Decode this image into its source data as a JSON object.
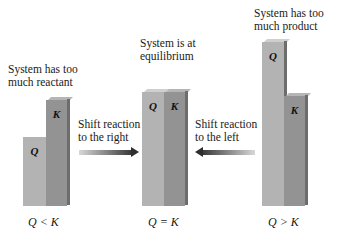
{
  "groups": [
    {
      "id": "left",
      "caption": [
        "System has too",
        "much reactant"
      ],
      "bars": [
        {
          "label": "Q",
          "relative_height": 60
        },
        {
          "label": "K",
          "relative_height": 100
        }
      ],
      "relation": "Q < K"
    },
    {
      "id": "center",
      "caption": [
        "System is at",
        "equilibrium"
      ],
      "bars": [
        {
          "label": "Q",
          "relative_height": 114
        },
        {
          "label": "K",
          "relative_height": 114
        }
      ],
      "relation": "Q = K"
    },
    {
      "id": "right",
      "caption": [
        "System has too",
        "much product"
      ],
      "bars": [
        {
          "label": "Q",
          "relative_height": 166
        },
        {
          "label": "K",
          "relative_height": 110
        }
      ],
      "relation": "Q > K"
    }
  ],
  "arrows": [
    {
      "direction": "right",
      "text": [
        "Shift reaction",
        "to the right"
      ]
    },
    {
      "direction": "left",
      "text": [
        "Shift reaction",
        "to the left"
      ]
    }
  ],
  "colors": {
    "q_bar": "#b3b3b3",
    "k_bar": "#939393",
    "side_face": "#6d6d6d",
    "arrow_dark": "#3a3a3a",
    "arrow_light": "#d8d8d8"
  }
}
